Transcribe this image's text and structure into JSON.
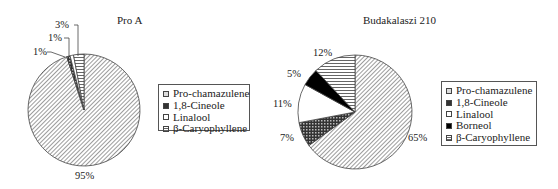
{
  "chart_data": [
    {
      "type": "pie",
      "title": "Pro A",
      "start_angle_deg": 0,
      "direction": "clockwise",
      "categories": [
        "Pro-chamazulene",
        "1,8-Cineole",
        "Linalool",
        "β-Caryophyllene"
      ],
      "values": [
        95,
        1,
        1,
        3
      ],
      "data_labels": [
        "95%",
        "1%",
        "1%",
        "3%"
      ],
      "fills": [
        "diagonal-hatch",
        "dark-crosshatch",
        "white",
        "horizontal-lines"
      ],
      "legend": {
        "position": "right",
        "entries": [
          "Pro-chamazulene",
          "1,8-Cineole",
          "Linalool",
          "β-Caryophyllene"
        ]
      }
    },
    {
      "type": "pie",
      "title": "Budakalaszi 210",
      "start_angle_deg": 0,
      "direction": "clockwise",
      "categories": [
        "Pro-chamazulene",
        "1,8-Cineole",
        "Linalool",
        "Borneol",
        "β-Caryophyllene"
      ],
      "values": [
        65,
        7,
        11,
        5,
        12
      ],
      "data_labels": [
        "65%",
        "7%",
        "11%",
        "5%",
        "12%"
      ],
      "fills": [
        "diagonal-hatch",
        "dark-crosshatch",
        "white",
        "black",
        "horizontal-lines"
      ],
      "legend": {
        "position": "right",
        "entries": [
          "Pro-chamazulene",
          "1,8-Cineole",
          "Linalool",
          "Borneol",
          "β-Caryophyllene"
        ]
      }
    }
  ],
  "charts": {
    "pro_a": {
      "title": "Pro A",
      "legend": [
        "Pro-chamazulene",
        "1,8-Cineole",
        "Linalool",
        "β-Caryophyllene"
      ],
      "labels": {
        "p95": "95%",
        "p1a": "1%",
        "p1b": "1%",
        "p3": "3%"
      }
    },
    "buda": {
      "title": "Budakalaszi 210",
      "legend": [
        "Pro-chamazulene",
        "1,8-Cineole",
        "Linalool",
        "Borneol",
        "β-Caryophyllene"
      ],
      "labels": {
        "p65": "65%",
        "p7": "7%",
        "p11": "11%",
        "p5": "5%",
        "p12": "12%"
      }
    }
  }
}
